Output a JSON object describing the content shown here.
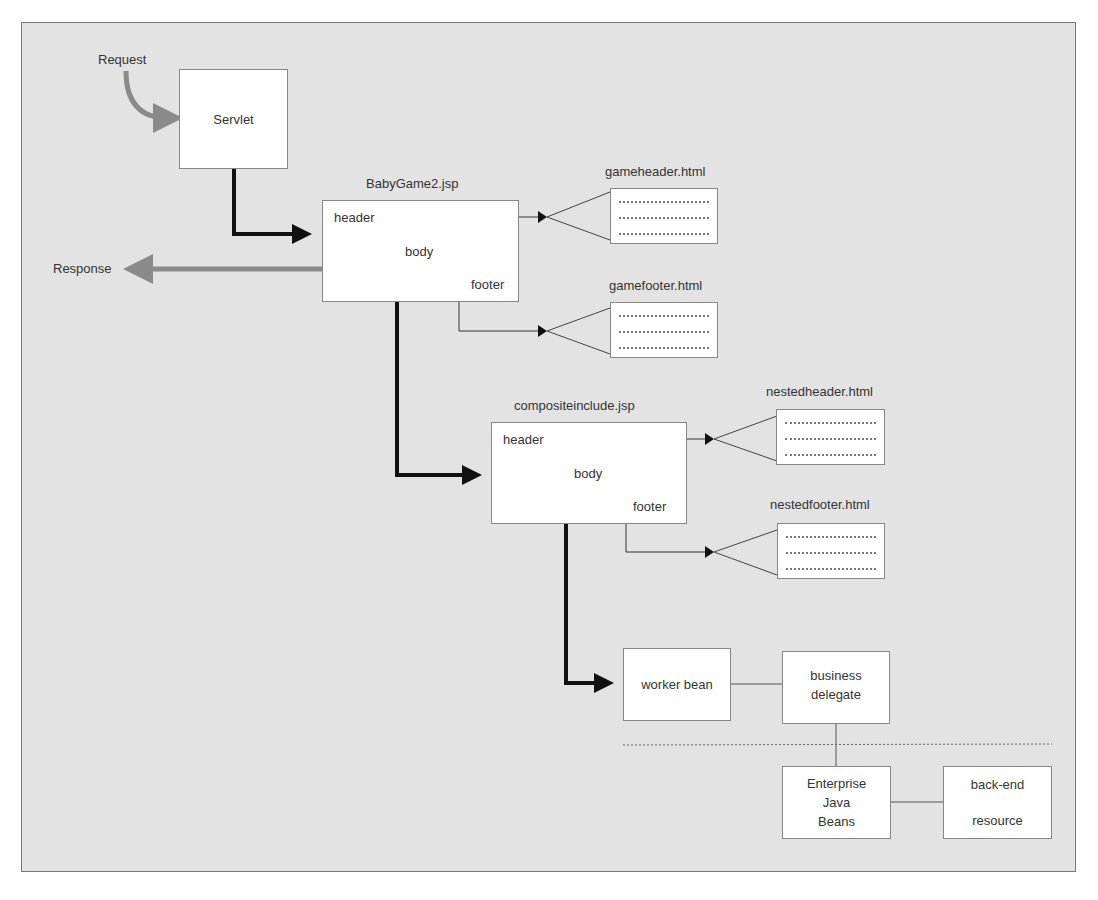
{
  "diagram": {
    "labels": {
      "request": "Request",
      "response": "Response"
    },
    "servlet": {
      "label": "Servlet"
    },
    "babygame": {
      "title": "BabyGame2.jsp",
      "header": "header",
      "body": "body",
      "footer": "footer"
    },
    "gameheader": {
      "title": "gameheader.html"
    },
    "gamefooter": {
      "title": "gamefooter.html"
    },
    "composite": {
      "title": "compositeinclude.jsp",
      "header": "header",
      "body": "body",
      "footer": "footer"
    },
    "nestedheader": {
      "title": "nestedheader.html"
    },
    "nestedfooter": {
      "title": "nestedfooter.html"
    },
    "worker_bean": {
      "label": "worker bean"
    },
    "business_delegate": {
      "line1": "business",
      "line2": "delegate"
    },
    "ejb": {
      "line1": "Enterprise",
      "line2": "Java",
      "line3": "Beans"
    },
    "backend": {
      "line1": "back-end",
      "line2": "resource"
    },
    "colors": {
      "background": "#e3e3e3",
      "request_arrow": "#8a8a8a",
      "main_flow": "#111111",
      "box_border": "#888888"
    }
  }
}
